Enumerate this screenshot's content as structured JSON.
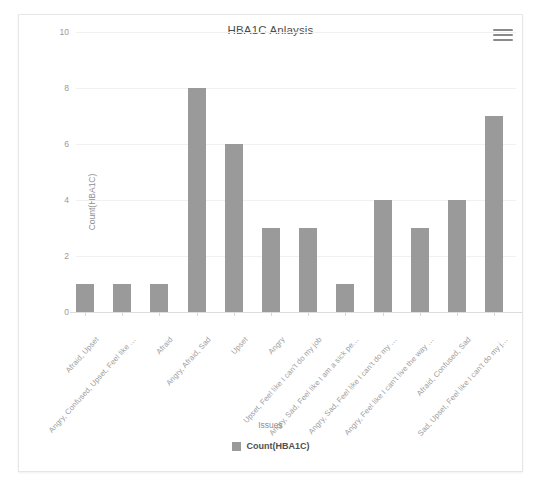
{
  "card": {
    "menu_icon": "hamburger-menu-icon"
  },
  "chart_data": {
    "type": "bar",
    "title": "HBA1C Anlaysis",
    "xlabel": "Issues",
    "ylabel": "Count(HBA1C)",
    "ylim": [
      0,
      10
    ],
    "yticks": [
      0,
      2,
      4,
      6,
      8,
      10
    ],
    "grid": true,
    "legend_position": "bottom",
    "series": [
      {
        "name": "Count(HBA1C)",
        "color": "#9a9a9a",
        "values": [
          1,
          1,
          1,
          8,
          6,
          3,
          3,
          1,
          4,
          3,
          4,
          7
        ]
      }
    ],
    "categories": [
      "Afraid, Upset",
      "Angry, Confused, Upset, Feel like …",
      "Afraid",
      "Angry, Afraid, Sad",
      "Upset",
      "Angry",
      "Upset, Feel like I can't do my job",
      "Angry, Sad, Feel like I am a sick pe…",
      "Angry, Sad, Feel like I can't do my …",
      "Angry, Feel like I can't live the way …",
      "Afraid, Confused, Sad",
      "Sad, Upset, Feel like I can't do my j…"
    ]
  }
}
